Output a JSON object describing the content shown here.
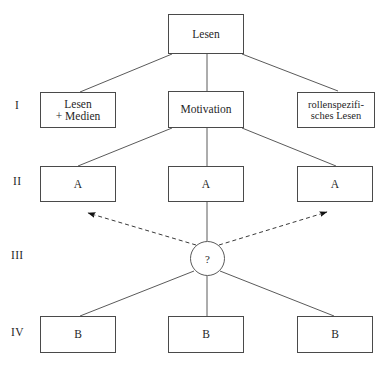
{
  "diagram": {
    "stroke_color": "#4a4a4a",
    "text_color": "#1f1f1f",
    "background_color": "#ffffff",
    "root": {
      "id": "root",
      "label": "Lesen"
    },
    "level_labels": [
      {
        "id": "level-1",
        "text": "I"
      },
      {
        "id": "level-2",
        "text": "II"
      },
      {
        "id": "level-3",
        "text": "III"
      },
      {
        "id": "level-4",
        "text": "IV"
      }
    ],
    "level_1": [
      {
        "id": "lesen-medien",
        "label": "Lesen\n+ Medien"
      },
      {
        "id": "motivation",
        "label": "Motivation"
      },
      {
        "id": "rollenspezifisches-lesen",
        "label": "rollenspezifi-\nsches Lesen"
      }
    ],
    "level_2": [
      {
        "id": "a-left",
        "label": "A"
      },
      {
        "id": "a-center",
        "label": "A"
      },
      {
        "id": "a-right",
        "label": "A"
      }
    ],
    "level_3": [
      {
        "id": "hub-question",
        "label": "?"
      }
    ],
    "level_4": [
      {
        "id": "b-left",
        "label": "B"
      },
      {
        "id": "b-center",
        "label": "B"
      },
      {
        "id": "b-right",
        "label": "B"
      }
    ],
    "edges": {
      "solid": [
        {
          "id": "root-to-lesen-medien",
          "x1": 172,
          "y1": 54,
          "x2": 80,
          "y2": 92
        },
        {
          "id": "root-to-motivation",
          "x1": 207,
          "y1": 54,
          "x2": 207,
          "y2": 91
        },
        {
          "id": "root-to-rollenspezifisches",
          "x1": 242,
          "y1": 54,
          "x2": 338,
          "y2": 91
        },
        {
          "id": "motivation-to-a-left",
          "x1": 172,
          "y1": 128,
          "x2": 78,
          "y2": 166
        },
        {
          "id": "motivation-to-a-center",
          "x1": 207,
          "y1": 128,
          "x2": 207,
          "y2": 166
        },
        {
          "id": "motivation-to-a-right",
          "x1": 242,
          "y1": 128,
          "x2": 336,
          "y2": 166
        },
        {
          "id": "a-center-to-hub",
          "x1": 207,
          "y1": 202,
          "x2": 207,
          "y2": 241
        },
        {
          "id": "hub-to-b-left",
          "x1": 194,
          "y1": 271,
          "x2": 80,
          "y2": 316
        },
        {
          "id": "hub-to-b-center",
          "x1": 207,
          "y1": 276,
          "x2": 207,
          "y2": 316
        },
        {
          "id": "hub-to-b-right",
          "x1": 220,
          "y1": 271,
          "x2": 334,
          "y2": 316
        }
      ],
      "dashed_arrows": [
        {
          "id": "hub-to-a-left-arrow",
          "x1": 196,
          "y1": 245,
          "x2": 88,
          "y2": 213
        },
        {
          "id": "hub-to-a-right-arrow",
          "x1": 219,
          "y1": 245,
          "x2": 327,
          "y2": 212
        }
      ]
    }
  }
}
